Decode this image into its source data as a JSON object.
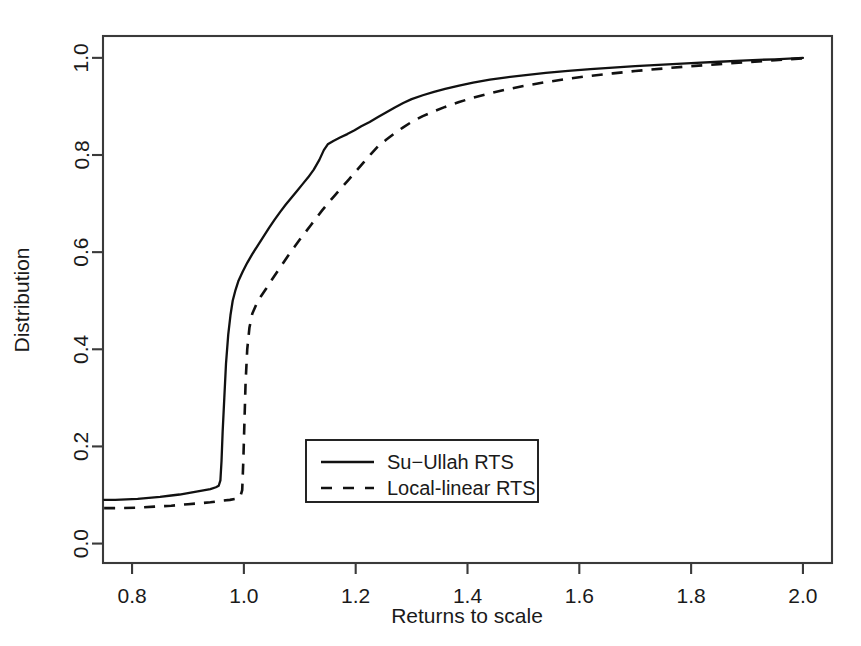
{
  "chart_data": {
    "type": "line",
    "title": "",
    "xlabel": "Returns to scale",
    "ylabel": "Distribution",
    "xlim": [
      0.748,
      2.052
    ],
    "ylim": [
      -0.04,
      1.045
    ],
    "xticks": [
      "0.8",
      "1.0",
      "1.2",
      "1.4",
      "1.6",
      "1.8",
      "2.0"
    ],
    "xtick_values": [
      0.8,
      1.0,
      1.2,
      1.4,
      1.6,
      1.8,
      2.0
    ],
    "yticks": [
      "0.0",
      "0.2",
      "0.4",
      "0.6",
      "0.8",
      "1.0"
    ],
    "ytick_values": [
      0.0,
      0.2,
      0.4,
      0.6,
      0.8,
      1.0
    ],
    "grid": false,
    "legend_position": "center-left-lower",
    "legend": [
      "Su−Ullah RTS",
      "Local-linear RTS"
    ],
    "series": [
      {
        "name": "Su−Ullah RTS",
        "style": "solid",
        "color": "#111111",
        "points": [
          [
            0.75,
            0.09
          ],
          [
            0.77,
            0.09
          ],
          [
            0.79,
            0.091
          ],
          [
            0.81,
            0.092
          ],
          [
            0.83,
            0.094
          ],
          [
            0.85,
            0.096
          ],
          [
            0.87,
            0.099
          ],
          [
            0.885,
            0.101
          ],
          [
            0.9,
            0.104
          ],
          [
            0.91,
            0.106
          ],
          [
            0.92,
            0.108
          ],
          [
            0.93,
            0.11
          ],
          [
            0.94,
            0.112
          ],
          [
            0.95,
            0.116
          ],
          [
            0.955,
            0.119
          ],
          [
            0.958,
            0.13
          ],
          [
            0.96,
            0.17
          ],
          [
            0.962,
            0.23
          ],
          [
            0.965,
            0.3
          ],
          [
            0.968,
            0.37
          ],
          [
            0.972,
            0.43
          ],
          [
            0.976,
            0.47
          ],
          [
            0.98,
            0.5
          ],
          [
            0.985,
            0.522
          ],
          [
            0.99,
            0.54
          ],
          [
            0.998,
            0.56
          ],
          [
            1.006,
            0.578
          ],
          [
            1.015,
            0.596
          ],
          [
            1.025,
            0.614
          ],
          [
            1.035,
            0.632
          ],
          [
            1.045,
            0.65
          ],
          [
            1.055,
            0.667
          ],
          [
            1.065,
            0.683
          ],
          [
            1.075,
            0.698
          ],
          [
            1.085,
            0.712
          ],
          [
            1.095,
            0.726
          ],
          [
            1.105,
            0.74
          ],
          [
            1.115,
            0.754
          ],
          [
            1.125,
            0.77
          ],
          [
            1.135,
            0.79
          ],
          [
            1.143,
            0.81
          ],
          [
            1.15,
            0.822
          ],
          [
            1.16,
            0.829
          ],
          [
            1.172,
            0.836
          ],
          [
            1.185,
            0.843
          ],
          [
            1.198,
            0.851
          ],
          [
            1.21,
            0.859
          ],
          [
            1.225,
            0.868
          ],
          [
            1.24,
            0.878
          ],
          [
            1.255,
            0.888
          ],
          [
            1.27,
            0.898
          ],
          [
            1.285,
            0.907
          ],
          [
            1.3,
            0.915
          ],
          [
            1.32,
            0.923
          ],
          [
            1.34,
            0.93
          ],
          [
            1.36,
            0.936
          ],
          [
            1.385,
            0.943
          ],
          [
            1.41,
            0.949
          ],
          [
            1.44,
            0.955
          ],
          [
            1.47,
            0.96
          ],
          [
            1.5,
            0.964
          ],
          [
            1.54,
            0.969
          ],
          [
            1.58,
            0.973
          ],
          [
            1.62,
            0.977
          ],
          [
            1.66,
            0.98
          ],
          [
            1.7,
            0.983
          ],
          [
            1.75,
            0.986
          ],
          [
            1.8,
            0.989
          ],
          [
            1.85,
            0.992
          ],
          [
            1.9,
            0.995
          ],
          [
            1.95,
            0.997
          ],
          [
            2.0,
            1.0
          ]
        ]
      },
      {
        "name": "Local-linear RTS",
        "style": "dashed",
        "color": "#111111",
        "points": [
          [
            0.75,
            0.073
          ],
          [
            0.78,
            0.073
          ],
          [
            0.81,
            0.074
          ],
          [
            0.84,
            0.076
          ],
          [
            0.87,
            0.078
          ],
          [
            0.9,
            0.081
          ],
          [
            0.92,
            0.083
          ],
          [
            0.94,
            0.085
          ],
          [
            0.96,
            0.088
          ],
          [
            0.975,
            0.09
          ],
          [
            0.985,
            0.092
          ],
          [
            0.993,
            0.094
          ],
          [
            0.997,
            0.11
          ],
          [
            0.999,
            0.17
          ],
          [
            1.001,
            0.25
          ],
          [
            1.003,
            0.33
          ],
          [
            1.006,
            0.4
          ],
          [
            1.01,
            0.445
          ],
          [
            1.015,
            0.473
          ],
          [
            1.022,
            0.492
          ],
          [
            1.03,
            0.508
          ],
          [
            1.04,
            0.525
          ],
          [
            1.05,
            0.543
          ],
          [
            1.06,
            0.56
          ],
          [
            1.07,
            0.577
          ],
          [
            1.08,
            0.594
          ],
          [
            1.09,
            0.61
          ],
          [
            1.1,
            0.626
          ],
          [
            1.11,
            0.641
          ],
          [
            1.12,
            0.656
          ],
          [
            1.13,
            0.671
          ],
          [
            1.14,
            0.686
          ],
          [
            1.15,
            0.7
          ],
          [
            1.162,
            0.716
          ],
          [
            1.175,
            0.733
          ],
          [
            1.188,
            0.75
          ],
          [
            1.2,
            0.766
          ],
          [
            1.215,
            0.786
          ],
          [
            1.228,
            0.803
          ],
          [
            1.24,
            0.818
          ],
          [
            1.255,
            0.832
          ],
          [
            1.27,
            0.845
          ],
          [
            1.285,
            0.857
          ],
          [
            1.3,
            0.868
          ],
          [
            1.32,
            0.88
          ],
          [
            1.34,
            0.89
          ],
          [
            1.36,
            0.899
          ],
          [
            1.385,
            0.909
          ],
          [
            1.41,
            0.918
          ],
          [
            1.44,
            0.927
          ],
          [
            1.47,
            0.935
          ],
          [
            1.5,
            0.942
          ],
          [
            1.54,
            0.95
          ],
          [
            1.58,
            0.957
          ],
          [
            1.62,
            0.963
          ],
          [
            1.66,
            0.968
          ],
          [
            1.7,
            0.973
          ],
          [
            1.75,
            0.978
          ],
          [
            1.8,
            0.983
          ],
          [
            1.85,
            0.987
          ],
          [
            1.9,
            0.991
          ],
          [
            1.95,
            0.995
          ],
          [
            2.0,
            0.999
          ]
        ]
      }
    ]
  },
  "axes": {
    "x_title": "Returns to scale",
    "y_title": "Distribution"
  },
  "legend": {
    "entries": [
      {
        "label": "Su−Ullah RTS",
        "style": "solid"
      },
      {
        "label": "Local-linear RTS",
        "style": "dashed"
      }
    ]
  }
}
